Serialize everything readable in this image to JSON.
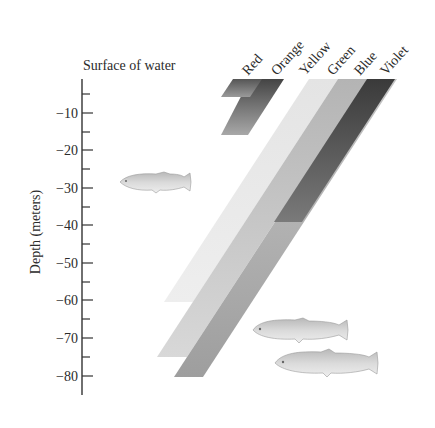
{
  "diagram": {
    "surface_label": "Surface of water",
    "y_axis_label": "Depth (meters)",
    "y_ticks": [
      {
        "value": -10,
        "label": "−10"
      },
      {
        "value": -20,
        "label": "−20"
      },
      {
        "value": -30,
        "label": "−30"
      },
      {
        "value": -40,
        "label": "−40"
      },
      {
        "value": -50,
        "label": "−50"
      },
      {
        "value": -60,
        "label": "−60"
      },
      {
        "value": -70,
        "label": "−70"
      },
      {
        "value": -80,
        "label": "−80"
      }
    ],
    "light_bands": [
      {
        "name": "Red",
        "label": "Red",
        "penetration_depth_m": -5,
        "shade": "#5f5f5f"
      },
      {
        "name": "Orange",
        "label": "Orange",
        "penetration_depth_m": -15,
        "shade": "#7c7c7c"
      },
      {
        "name": "Yellow",
        "label": "Yellow",
        "penetration_depth_m": -60,
        "shade": "#e6e6e6"
      },
      {
        "name": "Green",
        "label": "Green",
        "penetration_depth_m": -75,
        "shade": "#c4c4c4"
      },
      {
        "name": "Blue",
        "label": "Blue",
        "penetration_depth_m": -80,
        "shade": "#a9a9a9"
      },
      {
        "name": "Violet",
        "label": "Violet",
        "penetration_depth_m": -40,
        "shade": "#4a4a4a"
      }
    ],
    "fish": [
      {
        "name": "fish-shallow",
        "depth_m": -28
      },
      {
        "name": "fish-deep-1",
        "depth_m": -72
      },
      {
        "name": "fish-deep-2",
        "depth_m": -78
      }
    ]
  }
}
